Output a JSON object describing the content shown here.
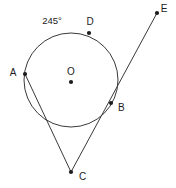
{
  "figure": {
    "name": "circle-tangent-secant-diagram",
    "background_color": "#ffffff",
    "stroke_color": "#3a3a3a",
    "label_color": "#1c1c1c",
    "width": 176,
    "height": 188
  },
  "chart_data": {
    "type": "diagram",
    "title": "",
    "subtitle": "",
    "xlabel": "",
    "ylabel": "",
    "grid": false,
    "legend": null,
    "circle": {
      "name": "circle-O",
      "center_label": "O",
      "cx": 71,
      "cy": 80,
      "r": 47
    },
    "points": [
      {
        "id": "A",
        "label": "A",
        "x": 25,
        "y": 74,
        "label_x": 13,
        "label_y": 73,
        "on_circle": true
      },
      {
        "id": "B",
        "label": "B",
        "x": 111,
        "y": 103,
        "label_x": 118,
        "label_y": 108,
        "on_circle": true
      },
      {
        "id": "C",
        "label": "C",
        "x": 71,
        "y": 172,
        "label_x": 79,
        "label_y": 177,
        "on_circle": false
      },
      {
        "id": "D",
        "label": "D",
        "x": 89,
        "y": 33,
        "label_x": 90,
        "label_y": 22,
        "on_circle": true
      },
      {
        "id": "E",
        "label": "E",
        "x": 157,
        "y": 13,
        "label_x": 164,
        "label_y": 9,
        "on_circle": false
      },
      {
        "id": "O",
        "label": "O",
        "x": 71,
        "y": 82,
        "label_x": 71,
        "label_y": 72,
        "on_circle": false
      }
    ],
    "segments": [
      {
        "name": "segment-A-to-C",
        "from": "A",
        "to": "C",
        "x1": 25,
        "y1": 74,
        "x2": 71,
        "y2": 172
      },
      {
        "name": "ray-C-through-B-to-E",
        "from": "C",
        "to": "E",
        "x1": 71,
        "y1": 172,
        "x2": 157,
        "y2": 13
      }
    ],
    "annotations": [
      {
        "id": "arc-measure",
        "text": "245°",
        "x": 52,
        "y": 21,
        "describes": "major arc measure"
      }
    ]
  }
}
